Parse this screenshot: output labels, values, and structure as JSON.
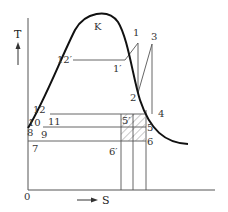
{
  "diagram": {
    "type": "T-S diagram (refrigeration cycle with saturation dome)",
    "axes": {
      "y_label": "T",
      "x_label": "S",
      "origin_label": "0"
    },
    "points": {
      "K": "K",
      "p1": "1",
      "p1p": "1′",
      "p2": "2",
      "p3": "3",
      "p4": "4",
      "p5": "5",
      "p5p": "5′",
      "p6": "6",
      "p6p": "6′",
      "p7": "7",
      "p8": "8",
      "p9": "9",
      "p10": "10",
      "p11": "11",
      "p12": "12",
      "p12p": "12′"
    },
    "colors": {
      "curve": "#111111",
      "lines": "#555555",
      "hatch": "#777777",
      "text": "#333333"
    }
  }
}
